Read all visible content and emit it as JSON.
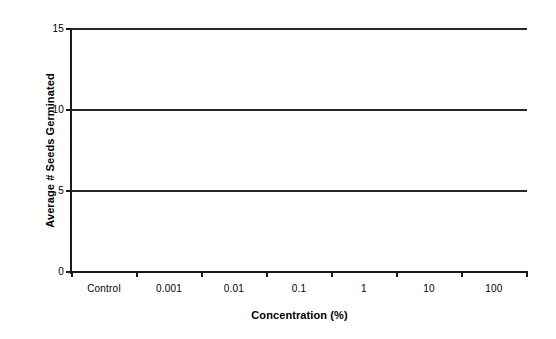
{
  "chart_data": {
    "type": "line",
    "title": "",
    "xlabel": "Concentration (%)",
    "ylabel": "Average # Seeds Germinated",
    "categories": [
      "Control",
      "0.001",
      "0.01",
      "0.1",
      "1",
      "10",
      "100"
    ],
    "ytick_labels": [
      "0",
      "5",
      "10",
      "15"
    ],
    "yticks": [
      0,
      5,
      10,
      15
    ],
    "ylim": [
      0,
      15
    ],
    "grid": false,
    "legend": "none",
    "series": [
      {
        "name": "Series at 15",
        "values": [
          15,
          15,
          15,
          15,
          15,
          15,
          15
        ],
        "color": "#262626"
      },
      {
        "name": "Series at 10",
        "values": [
          10,
          10,
          10,
          10,
          10,
          10,
          10
        ],
        "color": "#262626"
      },
      {
        "name": "Series at 5",
        "values": [
          5,
          5,
          5,
          5,
          5,
          5,
          5
        ],
        "color": "#262626"
      }
    ]
  },
  "axes": {
    "y_title": "Average # Seeds Germinated",
    "x_title": "Concentration (%)",
    "y_labels": [
      "15",
      "10",
      "5",
      "0"
    ],
    "x_labels": [
      "Control",
      "0.001",
      "0.01",
      "0.1",
      "1",
      "10",
      "100"
    ]
  },
  "colors": {
    "axis": "#1a1a1a",
    "series": "#262626",
    "background": "#ffffff",
    "text": "#000000"
  }
}
